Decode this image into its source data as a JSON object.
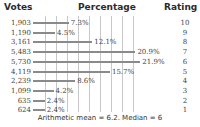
{
  "header": {
    "votes": "Votes",
    "percentage": "Percentage",
    "rating": "Rating"
  },
  "footer": "Arithmetic mean = 6.2. Median = 6",
  "rows": [
    {
      "votes": "1,903",
      "pct": "7.3%",
      "rating": "10"
    },
    {
      "votes": "1,190",
      "pct": "4.5%",
      "rating": "9"
    },
    {
      "votes": "3,161",
      "pct": "12.1%",
      "rating": "8"
    },
    {
      "votes": "5,483",
      "pct": "20.9%",
      "rating": "7"
    },
    {
      "votes": "5,730",
      "pct": "21.9%",
      "rating": "6"
    },
    {
      "votes": "4,119",
      "pct": "15.7%",
      "rating": "5"
    },
    {
      "votes": "2,239",
      "pct": "8.6%",
      "rating": "4"
    },
    {
      "votes": "1,099",
      "pct": "4.2%",
      "rating": "3"
    },
    {
      "votes": "635",
      "pct": "2.4%",
      "rating": "2"
    },
    {
      "votes": "624",
      "pct": "2.4%",
      "rating": "1"
    }
  ],
  "chart_data": {
    "type": "bar",
    "orientation": "horizontal",
    "title": "",
    "categories": [
      "10",
      "9",
      "8",
      "7",
      "6",
      "5",
      "4",
      "3",
      "2",
      "1"
    ],
    "series": [
      {
        "name": "Percentage",
        "values": [
          7.3,
          4.5,
          12.1,
          20.9,
          21.9,
          15.7,
          8.6,
          4.2,
          2.4,
          2.4
        ]
      },
      {
        "name": "Votes",
        "values": [
          1903,
          1190,
          3161,
          5483,
          5730,
          4119,
          2239,
          1099,
          635,
          624
        ]
      }
    ],
    "column_headers": [
      "Votes",
      "Percentage",
      "Rating"
    ],
    "xlabel": "Percentage",
    "ylabel": "Rating",
    "grid": true,
    "annotations": [
      "Arithmetic mean = 6.2. Median = 6"
    ]
  }
}
